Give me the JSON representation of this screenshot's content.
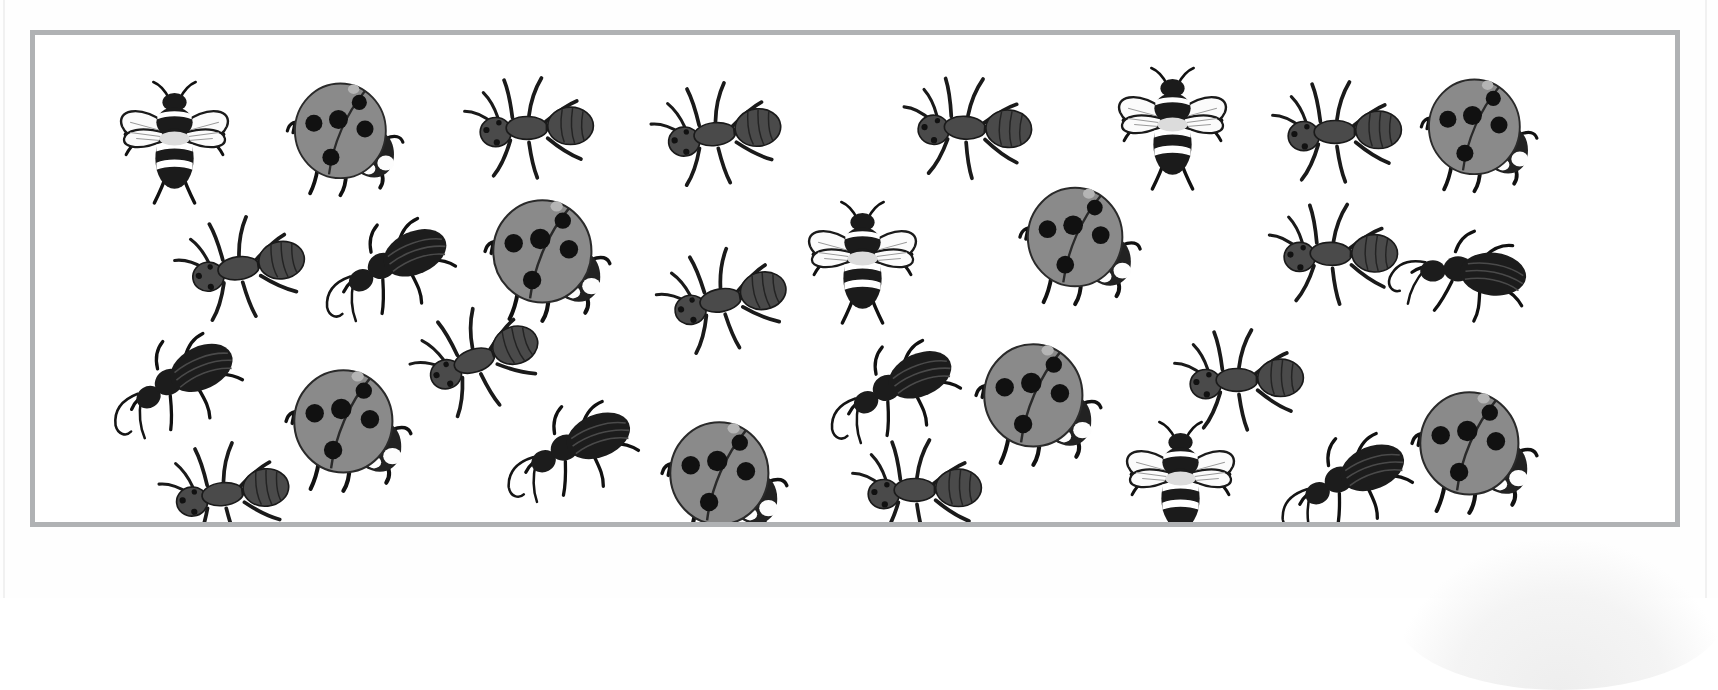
{
  "page": {
    "kind": "printed-worksheet-scan",
    "background_color": "#ffffff",
    "frame": {
      "border_color": "#b0b2b4",
      "border_width_px": 5,
      "fill_color": "#ffffff",
      "x": 30,
      "y": 30,
      "width": 1650,
      "height": 497
    },
    "watermark": {
      "name": "scan-shadow-blob",
      "color": "#eeeeee"
    }
  },
  "legend": {
    "bee": {
      "label": "bee",
      "body_color": "#1b1b1b",
      "stripe_color": "#ffffff",
      "wing_color": "#fbfbfb"
    },
    "ladybug": {
      "label": "ladybug",
      "shell_color": "#8a8a8a",
      "spot_color": "#111111",
      "head_color": "#222222"
    },
    "ant": {
      "label": "ant",
      "body_color": "#4a4a4a",
      "leg_color": "#1a1a1a"
    },
    "beetle": {
      "label": "beetle",
      "body_color": "#1c1c1c",
      "antenna_color": "#151515"
    }
  },
  "counts": {
    "bee": 4,
    "ladybug": 7,
    "ant": 11,
    "beetle": 7,
    "total": 29
  },
  "insects": [
    {
      "type": "bee",
      "name": "bee-1",
      "x": 62,
      "y": 52,
      "w": 165,
      "h": 125,
      "rot": 0
    },
    {
      "type": "ladybug",
      "name": "ladybug-1",
      "x": 252,
      "y": 44,
      "w": 130,
      "h": 125,
      "rot": 0
    },
    {
      "type": "ant",
      "name": "ant-1",
      "x": 424,
      "y": 46,
      "w": 150,
      "h": 108,
      "rot": 0
    },
    {
      "type": "ant",
      "name": "ant-2",
      "x": 612,
      "y": 52,
      "w": 150,
      "h": 108,
      "rot": -6
    },
    {
      "type": "ant",
      "name": "ant-3",
      "x": 862,
      "y": 46,
      "w": 150,
      "h": 108,
      "rot": 4
    },
    {
      "type": "bee",
      "name": "bee-2",
      "x": 1060,
      "y": 38,
      "w": 165,
      "h": 125,
      "rot": 0
    },
    {
      "type": "ant",
      "name": "ant-4",
      "x": 1232,
      "y": 50,
      "w": 150,
      "h": 108,
      "rot": 0
    },
    {
      "type": "ladybug",
      "name": "ladybug-2",
      "x": 1386,
      "y": 40,
      "w": 130,
      "h": 125,
      "rot": 0
    },
    {
      "type": "ant",
      "name": "ant-5",
      "x": 136,
      "y": 186,
      "w": 150,
      "h": 108,
      "rot": -8
    },
    {
      "type": "beetle",
      "name": "beetle-1",
      "x": 283,
      "y": 184,
      "w": 150,
      "h": 105,
      "rot": -12
    },
    {
      "type": "ladybug",
      "name": "ladybug-3",
      "x": 447,
      "y": 160,
      "w": 145,
      "h": 135,
      "rot": 0
    },
    {
      "type": "ant",
      "name": "ant-6",
      "x": 618,
      "y": 218,
      "w": 150,
      "h": 108,
      "rot": -10
    },
    {
      "type": "bee",
      "name": "bee-3",
      "x": 750,
      "y": 172,
      "w": 165,
      "h": 125,
      "rot": 0
    },
    {
      "type": "ladybug",
      "name": "ladybug-4",
      "x": 982,
      "y": 148,
      "w": 140,
      "h": 130,
      "rot": 0
    },
    {
      "type": "ant",
      "name": "ant-7",
      "x": 1228,
      "y": 172,
      "w": 150,
      "h": 108,
      "rot": 2
    },
    {
      "type": "beetle",
      "name": "beetle-2",
      "x": 1358,
      "y": 190,
      "w": 150,
      "h": 105,
      "rot": 18
    },
    {
      "type": "beetle",
      "name": "beetle-3",
      "x": 70,
      "y": 300,
      "w": 150,
      "h": 105,
      "rot": -14
    },
    {
      "type": "ant",
      "name": "ant-8",
      "x": 372,
      "y": 278,
      "w": 150,
      "h": 108,
      "rot": -18
    },
    {
      "type": "ladybug",
      "name": "ladybug-5",
      "x": 248,
      "y": 330,
      "w": 145,
      "h": 135,
      "rot": 0
    },
    {
      "type": "beetle",
      "name": "beetle-4",
      "x": 466,
      "y": 366,
      "w": 150,
      "h": 105,
      "rot": -10
    },
    {
      "type": "beetle",
      "name": "beetle-5",
      "x": 788,
      "y": 306,
      "w": 150,
      "h": 105,
      "rot": -12
    },
    {
      "type": "ladybug",
      "name": "ladybug-6",
      "x": 938,
      "y": 304,
      "w": 145,
      "h": 135,
      "rot": 0
    },
    {
      "type": "ant",
      "name": "ant-9",
      "x": 1134,
      "y": 298,
      "w": 150,
      "h": 108,
      "rot": 0
    },
    {
      "type": "ladybug",
      "name": "ladybug-7",
      "x": 1374,
      "y": 352,
      "w": 145,
      "h": 135,
      "rot": 0
    },
    {
      "type": "ant",
      "name": "ant-10",
      "x": 120,
      "y": 412,
      "w": 150,
      "h": 108,
      "rot": -6
    },
    {
      "type": "ladybug",
      "name": "ladybug-8",
      "x": 624,
      "y": 382,
      "w": 145,
      "h": 135,
      "rot": 0
    },
    {
      "type": "ant",
      "name": "ant-11",
      "x": 812,
      "y": 408,
      "w": 150,
      "h": 108,
      "rot": 0
    },
    {
      "type": "bee",
      "name": "bee-4",
      "x": 1068,
      "y": 392,
      "w": 165,
      "h": 125,
      "rot": 0
    },
    {
      "type": "beetle",
      "name": "beetle-6",
      "x": 1240,
      "y": 398,
      "w": 150,
      "h": 105,
      "rot": -10
    },
    {
      "type": "beetle",
      "name": "beetle-7",
      "x": 1320,
      "y": 64,
      "w": 0,
      "h": 0,
      "rot": 0
    }
  ]
}
